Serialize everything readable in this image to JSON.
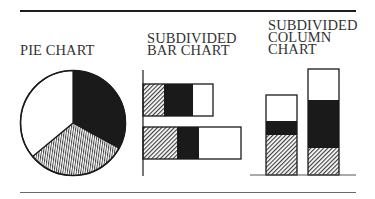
{
  "panels": {
    "pie": {
      "title_lines": [
        "PIE CHART"
      ]
    },
    "bar": {
      "title_lines": [
        "SUBDIVIDED",
        "BAR CHART"
      ]
    },
    "column": {
      "title_lines": [
        "SUBDIVIDED",
        "COLUMN",
        "CHART"
      ]
    }
  },
  "colors": {
    "ink": "#1a1a1a",
    "fill_white": "#ffffff",
    "fill_black": "#1a1a1a",
    "rule": "#1e1e1e"
  },
  "chart_data": [
    {
      "type": "pie",
      "title": "PIE CHART",
      "segments": [
        {
          "name": "black",
          "fill": "solid-black",
          "value": 33
        },
        {
          "name": "hatched",
          "fill": "vertical-hatch",
          "value": 31
        },
        {
          "name": "white",
          "fill": "white",
          "value": 36
        }
      ],
      "start_angle_deg": 0,
      "direction": "clockwise"
    },
    {
      "type": "bar",
      "orientation": "horizontal",
      "stacked": true,
      "title": "SUBDIVIDED BAR CHART",
      "categories": [
        "Bar 1",
        "Bar 2"
      ],
      "series": [
        {
          "name": "hatched",
          "fill": "diagonal-hatch",
          "values": [
            21,
            34
          ]
        },
        {
          "name": "black",
          "fill": "solid-black",
          "values": [
            29,
            22
          ]
        },
        {
          "name": "white",
          "fill": "white",
          "values": [
            20,
            42
          ]
        }
      ],
      "xlabel": "",
      "ylabel": "",
      "grid": false
    },
    {
      "type": "bar",
      "orientation": "vertical",
      "stacked": true,
      "title": "SUBDIVIDED COLUMN CHART",
      "categories": [
        "Column 1",
        "Column 2"
      ],
      "series": [
        {
          "name": "hatched",
          "fill": "diagonal-hatch",
          "values": [
            40,
            27
          ]
        },
        {
          "name": "black",
          "fill": "solid-black",
          "values": [
            14,
            48
          ]
        },
        {
          "name": "white",
          "fill": "white",
          "values": [
            26,
            31
          ]
        }
      ],
      "xlabel": "",
      "ylabel": "",
      "grid": false
    }
  ]
}
